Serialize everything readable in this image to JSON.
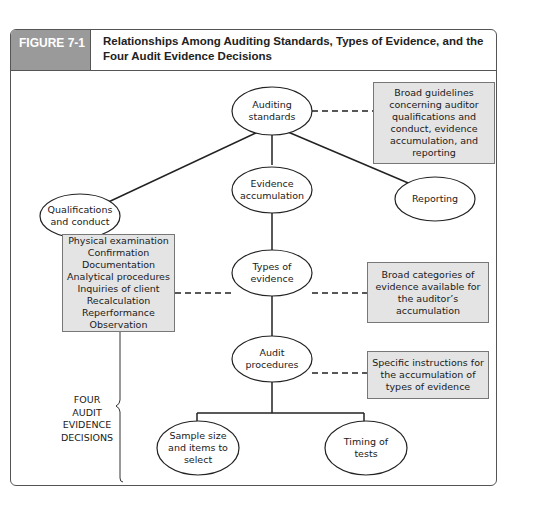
{
  "figure": {
    "label": "FIGURE 7-1",
    "title": "Relationships Among Auditing Standards, Types of Evidence, and the Four Audit Evidence Decisions"
  },
  "nodes": {
    "auditing_standards": "Auditing standards",
    "qualifications": "Qualifications and conduct",
    "evidence_accumulation": "Evidence accumulation",
    "reporting": "Reporting",
    "types_of_evidence": "Types of evidence",
    "audit_procedures": "Audit procedures",
    "sample_size": "Sample size and items to select",
    "timing": "Timing of tests"
  },
  "notes": {
    "standards_note": "Broad guidelines concerning auditor qualifications and conduct, evidence accumulation, and reporting",
    "types_note": "Broad categories of evidence available for the auditor’s accumulation",
    "procedures_note": "Specific instructions for the accumulation of types of evidence"
  },
  "evidence_types": [
    "Physical examination",
    "Confirmation",
    "Documentation",
    "Analytical procedures",
    "Inquiries of client",
    "Recalculation",
    "Reperformance",
    "Observation"
  ],
  "decisions_label": "FOUR AUDIT EVIDENCE DECISIONS",
  "colors": {
    "header_gray": "#9a9a9a",
    "box_fill": "#e4e4e4",
    "line": "#222222"
  }
}
